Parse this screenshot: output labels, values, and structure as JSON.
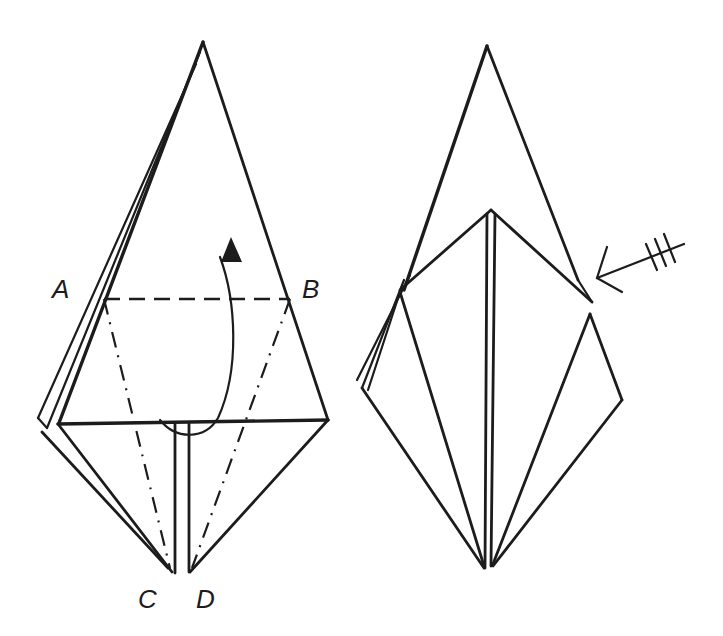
{
  "figure": {
    "type": "origami-instruction-diagram",
    "steps": [
      {
        "id": "step-left",
        "description": "Kite-shaped base with valley fold A-B and mountain folds A-C and B-D; lift bottom flap up along A-B",
        "labels": {
          "A": "A",
          "B": "B",
          "C": "C",
          "D": "D"
        },
        "fold_lines": [
          {
            "type": "valley",
            "from": "A",
            "to": "B"
          },
          {
            "type": "mountain",
            "from": "A",
            "to": "C"
          },
          {
            "type": "mountain",
            "from": "B",
            "to": "D"
          }
        ],
        "arrow": "fold-up-curved-arrow"
      },
      {
        "id": "step-right",
        "description": "Result after petal fold; repeat behind",
        "arrow": "repeat-behind-arrow",
        "arrow_tick_count": 3
      }
    ],
    "colors": {
      "line": "#1c1c1c",
      "background": "#ffffff"
    }
  }
}
